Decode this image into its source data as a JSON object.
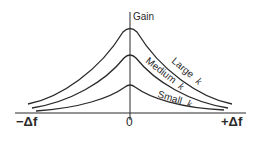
{
  "diagram": {
    "y_axis_label": "Gain",
    "x_tick_left": "−Δf",
    "x_tick_center": "0",
    "x_tick_right": "+Δf",
    "curves": [
      {
        "name": "Large k",
        "word": "Large",
        "symbol": "k",
        "peak_y": 28
      },
      {
        "name": "Medium k",
        "word": "Medium",
        "symbol": "k",
        "peak_y": 54
      },
      {
        "name": "Small k",
        "word": "Small",
        "symbol": "k",
        "peak_y": 84
      }
    ],
    "colors": {
      "ink": "#2a2a2a",
      "background": "#ffffff"
    }
  }
}
